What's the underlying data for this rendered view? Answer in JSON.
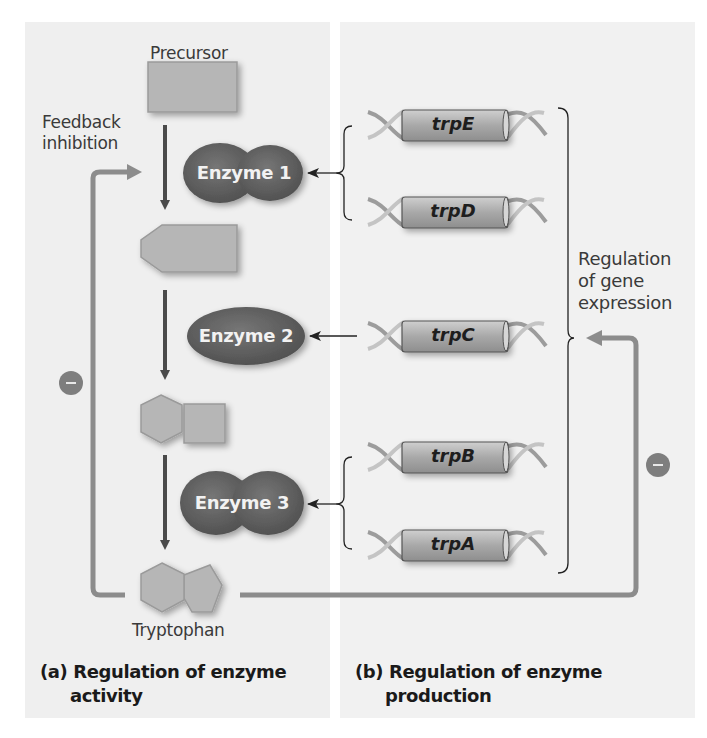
{
  "diagram": {
    "panels": [
      {
        "id": "a",
        "caption_prefix": "(a)",
        "caption_line1": "Regulation of enzyme",
        "caption_line2": "activity"
      },
      {
        "id": "b",
        "caption_prefix": "(b)",
        "caption_line1": "Regulation of enzyme",
        "caption_line2": "production"
      }
    ],
    "pathway": {
      "start_label": "Precursor",
      "end_label": "Tryptophan",
      "feedback_label_line1": "Feedback",
      "feedback_label_line2": "inhibition",
      "enzymes": [
        {
          "label": "Enzyme 1",
          "shape": "double-lobe"
        },
        {
          "label": "Enzyme 2",
          "shape": "ellipse"
        },
        {
          "label": "Enzyme 3",
          "shape": "double-lobe"
        }
      ],
      "inhibition_symbol": "minus-icon"
    },
    "genes": [
      {
        "label": "trpE",
        "enzyme": "Enzyme 1"
      },
      {
        "label": "trpD",
        "enzyme": "Enzyme 1"
      },
      {
        "label": "trpC",
        "enzyme": "Enzyme 2"
      },
      {
        "label": "trpB",
        "enzyme": "Enzyme 3"
      },
      {
        "label": "trpA",
        "enzyme": "Enzyme 3"
      }
    ],
    "gene_regulation_label_line1": "Regulation",
    "gene_regulation_label_line2": "of gene",
    "gene_regulation_label_line3": "expression",
    "colors": {
      "enzyme_fill": "#5e5e5e",
      "substrate_fill": "#b4b4b4",
      "feedback_line": "#8c8c8c",
      "pathway_arrow": "#4a4a4a",
      "gene_cylinder": "#a6a6a6",
      "panel_bg": "#efefef"
    }
  }
}
